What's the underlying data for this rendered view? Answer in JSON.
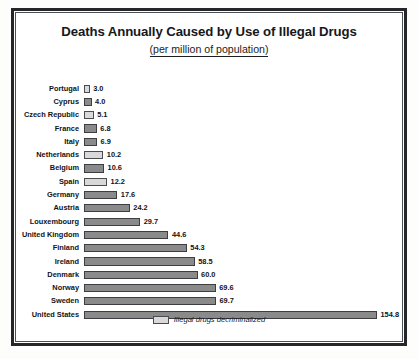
{
  "chart_data": {
    "type": "bar",
    "orientation": "horizontal",
    "title": "Deaths Annually Caused by Use of Illegal Drugs",
    "subtitle": "(per million of population)",
    "xlabel": "",
    "ylabel": "",
    "xlim": [
      0,
      154.8
    ],
    "grid": false,
    "legend_position": "bottom-center",
    "legend": [
      {
        "label": "Illegal drugs decriminalized",
        "fill": "light"
      }
    ],
    "categories": [
      "Portugal",
      "Cyprus",
      "Czech Republic",
      "France",
      "Italy",
      "Netherlands",
      "Belgium",
      "Spain",
      "Germany",
      "Austria",
      "Louxembourg",
      "United Kingdom",
      "Finland",
      "Ireland",
      "Denmark",
      "Norway",
      "Sweden",
      "United States"
    ],
    "values": [
      3.0,
      4.0,
      5.1,
      6.8,
      6.9,
      10.2,
      10.6,
      12.2,
      17.6,
      24.2,
      29.7,
      44.6,
      54.3,
      58.5,
      60.0,
      69.6,
      69.7,
      154.8
    ],
    "value_labels": [
      "3.0",
      "4.0",
      "5.1",
      "6.8",
      "6.9",
      "10.2",
      "10.6",
      "12.2",
      "17.6",
      "24.2",
      "29.7",
      "44.6",
      "54.3",
      "58.5",
      "60.0",
      "69.6",
      "69.7",
      "154.8"
    ],
    "decriminalized": [
      true,
      false,
      true,
      false,
      false,
      true,
      false,
      true,
      false,
      false,
      false,
      false,
      false,
      false,
      false,
      false,
      false,
      false
    ],
    "colors": {
      "bar_standard": "#8a8a8a",
      "bar_decriminalized": "#d9d9d9",
      "bar_outline": "#3c3e42",
      "text": "#111316",
      "frame": "#24262a"
    }
  }
}
